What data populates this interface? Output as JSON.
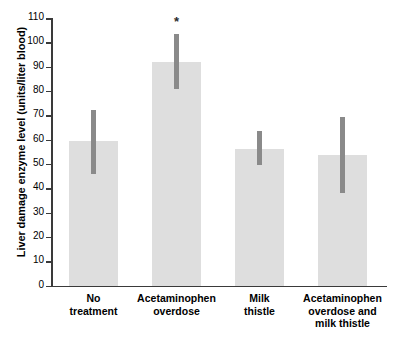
{
  "chart_data": {
    "type": "bar",
    "title": "",
    "xlabel": "",
    "ylabel": "Liver damage enzyme level (units/liter blood)",
    "ylim": [
      0,
      110
    ],
    "ytick_step": 10,
    "yticks": [
      0,
      10,
      20,
      30,
      40,
      50,
      60,
      70,
      80,
      90,
      100,
      110
    ],
    "ytick_labels": [
      "0",
      "10",
      "20",
      "30",
      "40",
      "50",
      "60",
      "70",
      "80",
      "90",
      "100",
      "110"
    ],
    "grid": false,
    "legend": null,
    "categories": [
      "No\ntreatment",
      "Acetaminophen\noverdose",
      "Milk\nthistle",
      "Acetaminophen\noverdose and\nmilk thistle"
    ],
    "values": [
      59.5,
      92,
      56,
      53.5
    ],
    "error_low": [
      46,
      81,
      49.5,
      38
    ],
    "error_high": [
      72,
      103.5,
      63.5,
      69.5
    ],
    "annotations": [
      {
        "category_index": 1,
        "text": "*",
        "y": 106
      }
    ],
    "colors": {
      "bar_fill": "#dedede",
      "error_bar": "#8a8a8a",
      "axis": "#3a3a3a",
      "text": "#000000"
    }
  }
}
